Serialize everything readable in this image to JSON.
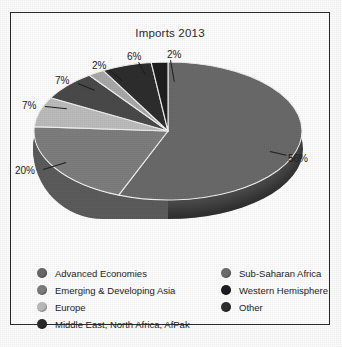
{
  "figure": {
    "title": "Imports 2013",
    "caption_partial": ""
  },
  "chart_data": {
    "type": "pie",
    "title": "Imports 2013",
    "xlabel": "",
    "ylabel": "",
    "categories": [
      "Advanced Economies",
      "Emerging & Developing Asia",
      "Europe",
      "Middle East, North Africa, AfPak",
      "Sub-Saharan Africa",
      "Western Hemisphere",
      "Other"
    ],
    "values": [
      56,
      20,
      7,
      7,
      2,
      6,
      2
    ],
    "value_labels": [
      "56%",
      "20%",
      "7%",
      "7%",
      "2%",
      "6%",
      "2%"
    ],
    "colors": [
      "#6a6a6a",
      "#7e7e7e",
      "#bdbdbd",
      "#4a4a4a",
      "#a9a9a9",
      "#2e2e2e",
      "#1f1f1f"
    ],
    "start_angle_deg": 0,
    "direction": "clockwise",
    "legend_position": "bottom",
    "grid": false,
    "three_d": true
  },
  "slices": [
    {
      "label": "56%",
      "value": 56,
      "name": "Advanced Economies",
      "color": "#6a6a6a"
    },
    {
      "label": "20%",
      "value": 20,
      "name": "Emerging & Developing Asia",
      "color": "#7e7e7e"
    },
    {
      "label": "7%",
      "value": 7,
      "name": "Europe",
      "color": "#bdbdbd"
    },
    {
      "label": "7%",
      "value": 7,
      "name": "Middle East, North Africa, AfPak",
      "color": "#4a4a4a"
    },
    {
      "label": "2%",
      "value": 2,
      "name": "Sub-Saharan Africa",
      "color": "#a9a9a9"
    },
    {
      "label": "6%",
      "value": 6,
      "name": "Western Hemisphere",
      "color": "#2e2e2e"
    },
    {
      "label": "2%",
      "value": 2,
      "name": "Other",
      "color": "#1f1f1f"
    }
  ],
  "legend": {
    "left_column": [
      {
        "label": "Advanced Economies",
        "color": "#6a6a6a"
      },
      {
        "label": "Emerging & Developing Asia",
        "color": "#7e7e7e"
      },
      {
        "label": "Europe",
        "color": "#bdbdbd"
      },
      {
        "label": "Middle East, North Africa, AfPak",
        "color": "#2b2b2b"
      }
    ],
    "right_column": [
      {
        "label": "Sub-Saharan Africa",
        "color": "#6f6f6f"
      },
      {
        "label": "Western Hemisphere",
        "color": "#1f1f1f"
      },
      {
        "label": "Other",
        "color": "#2e2e2e"
      }
    ]
  }
}
